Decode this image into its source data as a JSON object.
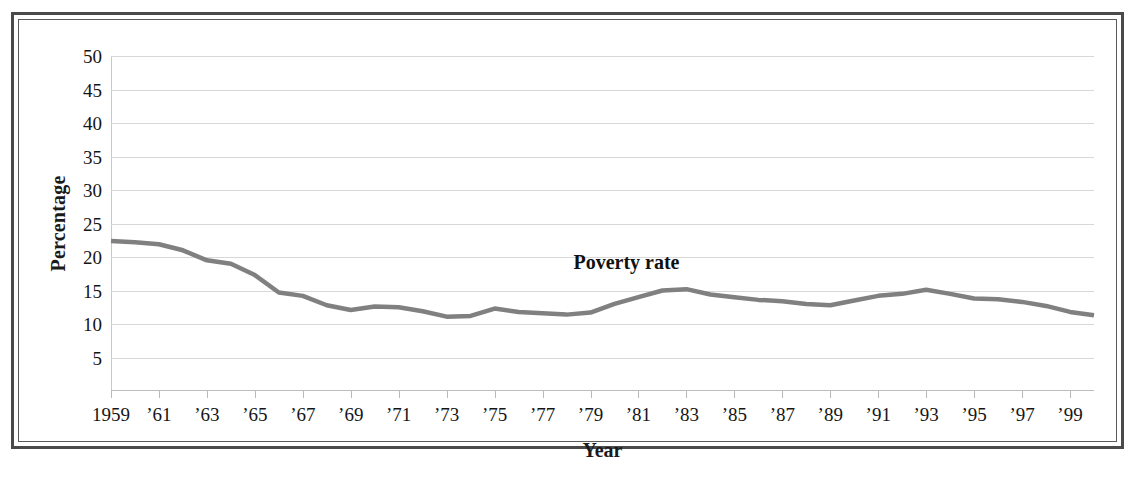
{
  "figure": {
    "frame_style": "double-rule-box",
    "background": "#ffffff",
    "line_color": "#808080"
  },
  "chart_data": {
    "type": "line",
    "title": "",
    "xlabel": "Year",
    "ylabel": "Percentage",
    "ylim": [
      0,
      50
    ],
    "xlim": [
      1959,
      2000
    ],
    "grid": true,
    "legend_position": "inline-annotation",
    "annotations": [
      {
        "text": "Poverty rate",
        "x": 1980.5,
        "y": 19.2
      }
    ],
    "y_ticks": [
      5,
      10,
      15,
      20,
      25,
      30,
      35,
      40,
      45,
      50
    ],
    "y_tick_labels": [
      "5",
      "10",
      "15",
      "20",
      "25",
      "30",
      "35",
      "40",
      "45",
      "50"
    ],
    "x_ticks": [
      1959,
      1961,
      1963,
      1965,
      1967,
      1969,
      1971,
      1973,
      1975,
      1977,
      1979,
      1981,
      1983,
      1985,
      1987,
      1989,
      1991,
      1993,
      1995,
      1997,
      1999
    ],
    "x_tick_labels": [
      "1959",
      "’61",
      "’63",
      "’65",
      "’67",
      "’69",
      "’71",
      "’73",
      "’75",
      "’77",
      "’79",
      "’81",
      "’83",
      "’85",
      "’87",
      "’89",
      "’91",
      "’93",
      "’95",
      "’97",
      "’99"
    ],
    "series": [
      {
        "name": "Poverty rate",
        "color": "#808080",
        "x": [
          1959,
          1960,
          1961,
          1962,
          1963,
          1964,
          1965,
          1966,
          1967,
          1968,
          1969,
          1970,
          1971,
          1972,
          1973,
          1974,
          1975,
          1976,
          1977,
          1978,
          1979,
          1980,
          1981,
          1982,
          1983,
          1984,
          1985,
          1986,
          1987,
          1988,
          1989,
          1990,
          1991,
          1992,
          1993,
          1994,
          1995,
          1996,
          1997,
          1998,
          1999,
          2000
        ],
        "values": [
          22.4,
          22.2,
          21.9,
          21.0,
          19.5,
          19.0,
          17.3,
          14.7,
          14.2,
          12.8,
          12.1,
          12.6,
          12.5,
          11.9,
          11.1,
          11.2,
          12.3,
          11.8,
          11.6,
          11.4,
          11.7,
          13.0,
          14.0,
          15.0,
          15.2,
          14.4,
          14.0,
          13.6,
          13.4,
          13.0,
          12.8,
          13.5,
          14.2,
          14.5,
          15.1,
          14.5,
          13.8,
          13.7,
          13.3,
          12.7,
          11.8,
          11.3
        ]
      }
    ]
  }
}
